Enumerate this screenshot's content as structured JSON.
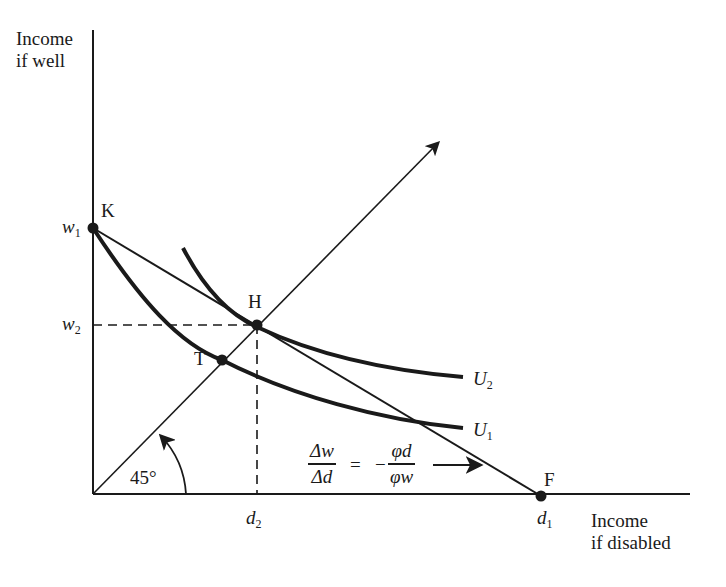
{
  "axes": {
    "y_label_line1": "Income",
    "y_label_line2": "if well",
    "x_label_line1": "Income",
    "x_label_line2": "if disabled"
  },
  "points": {
    "K": "K",
    "H": "H",
    "T": "T",
    "F": "F"
  },
  "ticks": {
    "w1": {
      "base": "w",
      "sub": "1"
    },
    "w2": {
      "base": "w",
      "sub": "2"
    },
    "d1": {
      "base": "d",
      "sub": "1"
    },
    "d2": {
      "base": "d",
      "sub": "2"
    }
  },
  "curves": {
    "U2": {
      "base": "U",
      "sub": "2"
    },
    "U1": {
      "base": "U",
      "sub": "1"
    }
  },
  "angle_label": "45°",
  "equation": {
    "lhs_num": "Δw",
    "lhs_den": "Δd",
    "equals": "=",
    "minus": "−",
    "rhs_num": "φd",
    "rhs_den": "φw"
  },
  "colors": {
    "ink": "#1a1a1a",
    "background": "#ffffff"
  }
}
